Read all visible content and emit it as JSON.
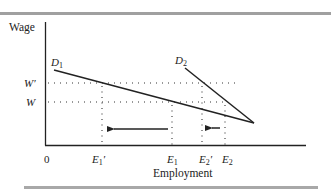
{
  "figure": {
    "y_axis_label": "Wage",
    "x_axis_label": "Employment",
    "origin_label": "0",
    "curves": [
      {
        "id": "D1",
        "label": "D",
        "subscript": "1"
      },
      {
        "id": "D2",
        "label": "D",
        "subscript": "2"
      }
    ],
    "wage_levels": [
      {
        "id": "W_prime",
        "label": "W′"
      },
      {
        "id": "W",
        "label": "W"
      }
    ],
    "employment_levels": [
      {
        "id": "E1_prime",
        "label": "E",
        "subscript": "1",
        "prime": "′"
      },
      {
        "id": "E1",
        "label": "E",
        "subscript": "1",
        "prime": ""
      },
      {
        "id": "E2_prime",
        "label": "E",
        "subscript": "2",
        "prime": "′"
      },
      {
        "id": "E2",
        "label": "E",
        "subscript": "2",
        "prime": ""
      }
    ],
    "arrows": [
      {
        "from": "E1",
        "to": "E1_prime",
        "direction": "left"
      },
      {
        "from": "E2",
        "to": "E2_prime",
        "direction": "left"
      }
    ]
  },
  "colors": {
    "line": "#222222",
    "rule": "#9a9a9a"
  }
}
